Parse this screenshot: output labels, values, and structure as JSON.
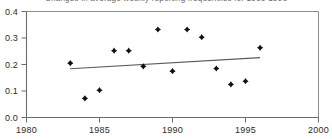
{
  "chart_data": {
    "type": "scatter",
    "title": "Changes in average weekly reporting frequencies for 1983-1996",
    "xlabel": "",
    "ylabel": "",
    "xlim": [
      1980,
      2000
    ],
    "ylim": [
      0.0,
      0.4
    ],
    "grid": false,
    "legend": "none",
    "xticks": [
      1980,
      1985,
      1990,
      1995,
      2000
    ],
    "xtick_labels": [
      "1980",
      "1985",
      "1990",
      "1995",
      "2000"
    ],
    "yticks": [
      0.0,
      0.1,
      0.2,
      0.3,
      0.4
    ],
    "ytick_labels": [
      "0.0",
      "0.1",
      "0.2",
      "0.3",
      "0.4"
    ],
    "x": [
      1983,
      1984,
      1985,
      1986,
      1987,
      1988,
      1989,
      1990,
      1991,
      1992,
      1993,
      1994,
      1995,
      1996
    ],
    "values": [
      0.205,
      0.072,
      0.103,
      0.252,
      0.252,
      0.193,
      0.332,
      0.175,
      0.332,
      0.303,
      0.185,
      0.125,
      0.137,
      0.263
    ],
    "series": [
      {
        "name": "Average weekly reporting frequency change",
        "marker": "diamond",
        "color": "#111111",
        "points": [
          {
            "x": 1983,
            "y": 0.205
          },
          {
            "x": 1984,
            "y": 0.072
          },
          {
            "x": 1985,
            "y": 0.103
          },
          {
            "x": 1986,
            "y": 0.252
          },
          {
            "x": 1987,
            "y": 0.252
          },
          {
            "x": 1988,
            "y": 0.193
          },
          {
            "x": 1989,
            "y": 0.332
          },
          {
            "x": 1990,
            "y": 0.175
          },
          {
            "x": 1991,
            "y": 0.332
          },
          {
            "x": 1992,
            "y": 0.303
          },
          {
            "x": 1993,
            "y": 0.185
          },
          {
            "x": 1994,
            "y": 0.125
          },
          {
            "x": 1995,
            "y": 0.137
          },
          {
            "x": 1996,
            "y": 0.263
          }
        ]
      },
      {
        "name": "Linear trend",
        "marker": "none",
        "color": "#5a5a5a",
        "points": [
          {
            "x": 1983,
            "y": 0.184
          },
          {
            "x": 1996,
            "y": 0.226
          }
        ]
      }
    ],
    "colors": {
      "point": "#111111",
      "trend": "#5a5a5a",
      "axis": "#6b6b6b",
      "frame": "#8e8e8e",
      "title": "#6e6e6e",
      "background": "#ffffff"
    }
  }
}
